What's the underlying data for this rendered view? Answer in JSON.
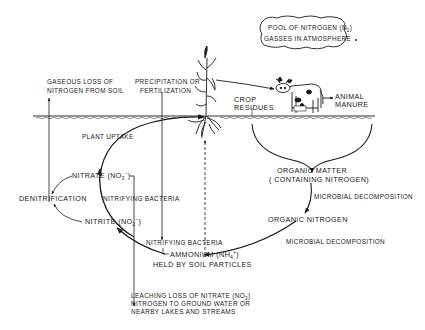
{
  "diagram": {
    "type": "nitrogen-cycle",
    "colors": {
      "ink": "#1a1a1a",
      "background": "#ffffff"
    },
    "atmosphere": {
      "line1_prefix": "POOL OF NITROGEN (N",
      "line1_sub": "2",
      "line1_suffix": ")",
      "line2": "GASSES IN ATMOSPHERE"
    },
    "labels": {
      "gaseous_loss_1": "GASEOUS LOSS OF",
      "gaseous_loss_2": "NITROGEN FROM SOIL",
      "precipitation_1": "PRECIPITATION OR",
      "precipitation_2": "FERTILIZATION",
      "crop_residues_1": "CROP",
      "crop_residues_2": "RESIDUES",
      "animal_manure_1": "ANIMAL",
      "animal_manure_2": "MANURE",
      "plant_uptake": "PLANT UPTAKE",
      "nitrate_prefix": "NITRATE (NO",
      "nitrate_sub": "3",
      "nitrate_sup": "−",
      "nitrate_suffix": ")",
      "denitrification": "DENITRIFICATION",
      "nitrifying_bacteria_1": "NITRIFYING BACTERIA",
      "nitrite_prefix": "NITRITE (NO",
      "nitrite_sub": "2",
      "nitrite_sup": "−",
      "nitrite_suffix": ")",
      "nitrifying_bacteria_2": "NITRIFYING BACTERIA",
      "ammonium_prefix": "AMMONIUM (NH",
      "ammonium_sub": "4",
      "ammonium_sup": "+",
      "ammonium_suffix": ")",
      "ammonium_line2": "HELD BY SOIL PARTICLES",
      "organic_matter_1": "ORGANIC MATTER",
      "organic_matter_2": "( CONTAINING NITROGEN)",
      "microbial_decomposition_1": "MICROBIAL DECOMPOSITION",
      "organic_nitrogen": "ORGANIC NITROGEN",
      "microbial_decomposition_2": "MICROBIAL DECOMPOSITION",
      "leaching_1_prefix": "LEACHING LOSS OF NITRATE (NO",
      "leaching_1_sub": "3",
      "leaching_1_suffix": ")",
      "leaching_2": "NITROGEN TO GROUND WATER OR",
      "leaching_3": "NEARBY LAKES AND STREAMS"
    },
    "icons": [
      "corn-plant-icon",
      "cow-icon",
      "cloud-bubble-icon"
    ]
  }
}
